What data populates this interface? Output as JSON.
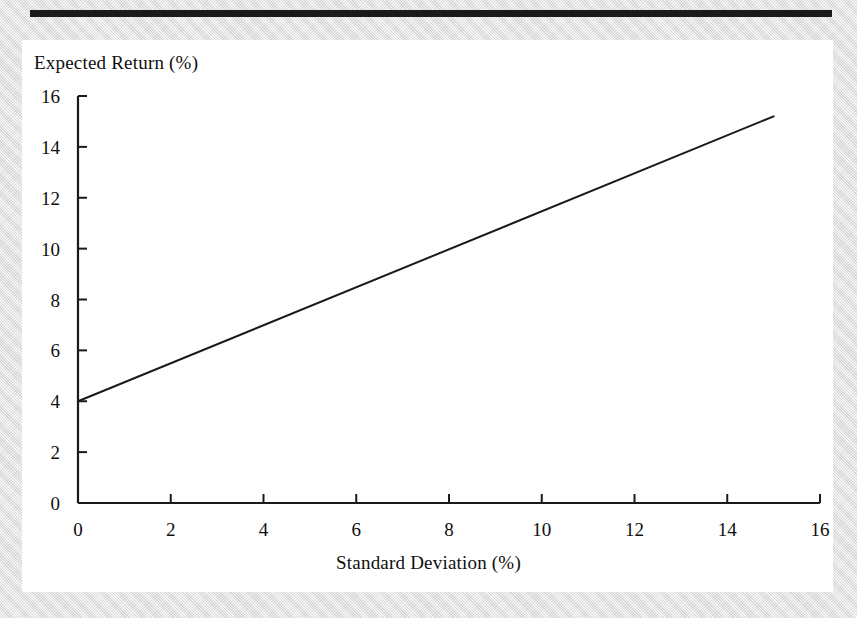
{
  "figure": {
    "top_rule": "horizontal-rule",
    "background": "#e6e6e6",
    "panel_background": "#ffffff"
  },
  "chart_data": {
    "type": "line",
    "title": "",
    "xlabel": "Standard Deviation (%)",
    "ylabel": "Expected Return (%)",
    "xlim": [
      0,
      16
    ],
    "ylim": [
      0,
      16
    ],
    "xticks": [
      0,
      2,
      4,
      6,
      8,
      10,
      12,
      14,
      16
    ],
    "xtick_labels": [
      "0",
      "2",
      "4",
      "6",
      "8",
      "10",
      "12",
      "14",
      "16"
    ],
    "yticks": [
      0,
      2,
      4,
      6,
      8,
      10,
      12,
      14,
      16
    ],
    "ytick_labels": [
      "0",
      "2",
      "4",
      "6",
      "8",
      "10",
      "12",
      "14",
      "16"
    ],
    "grid": false,
    "legend": false,
    "legend_position": "none",
    "tick_direction": "in",
    "axis_color": "#1a1a1a",
    "line_color": "#1a1a1a",
    "series": [
      {
        "name": "Capital Market Line",
        "x": [
          0,
          15
        ],
        "y": [
          4.0,
          15.2
        ],
        "intercept": 4.0,
        "slope": 0.747,
        "color": "#1a1a1a"
      }
    ],
    "annotations": []
  }
}
